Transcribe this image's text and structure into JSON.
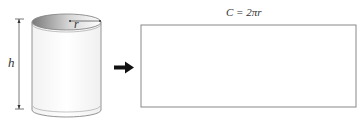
{
  "diagram": {
    "labels": {
      "height": "h",
      "radius": "r",
      "circumference": "C = 2πr"
    },
    "colors": {
      "stroke": "#888888",
      "arrow": "#111111",
      "label": "#333333",
      "interior_shade": "#8a8a8a"
    },
    "elements": [
      {
        "id": "cylinder",
        "type": "shape",
        "label_keys": [
          "height",
          "radius"
        ]
      },
      {
        "id": "arrow",
        "type": "arrow",
        "direction": "right"
      },
      {
        "id": "rectangle",
        "type": "shape",
        "label_keys": [
          "circumference"
        ]
      }
    ]
  }
}
